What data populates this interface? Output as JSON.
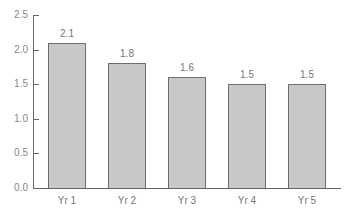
{
  "chart_data": {
    "type": "bar",
    "title": "",
    "xlabel": "",
    "ylabel": "",
    "categories": [
      "Yr 1",
      "Yr 2",
      "Yr 3",
      "Yr 4",
      "Yr 5"
    ],
    "values": [
      2.1,
      1.8,
      1.6,
      1.5,
      1.5
    ],
    "value_labels": [
      "2.1",
      "1.8",
      "1.6",
      "1.5",
      "1.5"
    ],
    "ylim": [
      0,
      2.5
    ],
    "yticks": [
      "0.0",
      "0.5",
      "1.0",
      "1.5",
      "2.0",
      "2.5"
    ],
    "grid": false,
    "legend": null,
    "bar_color": "#c8c8c8",
    "bar_edge_color": "#6e6e6e"
  }
}
